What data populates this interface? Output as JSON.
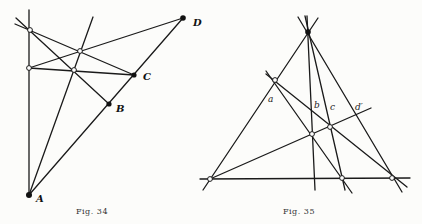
{
  "figures": [
    {
      "caption": "Fig. 34",
      "points": {
        "A": {
          "label": "A",
          "x": 29,
          "y": 195,
          "style": "filled"
        },
        "B": {
          "label": "B",
          "x": 109,
          "y": 104,
          "style": "filled"
        },
        "C": {
          "label": "C",
          "x": 134,
          "y": 75,
          "style": "filled"
        },
        "D": {
          "label": "D",
          "x": 183,
          "y": 18,
          "style": "filled"
        },
        "P1": {
          "label": "",
          "x": 30,
          "y": 30,
          "style": "open"
        },
        "P2": {
          "label": "",
          "x": 29,
          "y": 68,
          "style": "open"
        },
        "Q1": {
          "label": "",
          "x": 80,
          "y": 51,
          "style": "open"
        },
        "Q2": {
          "label": "",
          "x": 74,
          "y": 70,
          "style": "open"
        }
      }
    },
    {
      "caption": "Fig. 35",
      "points": {
        "V": {
          "label": "",
          "x": 308,
          "y": 32,
          "style": "filled"
        },
        "L": {
          "label": "",
          "x": 275,
          "y": 80,
          "style": "open"
        },
        "BL": {
          "label": "",
          "x": 210,
          "y": 179,
          "style": "open"
        },
        "BM": {
          "label": "",
          "x": 342,
          "y": 178,
          "style": "open"
        },
        "BR": {
          "label": "",
          "x": 392,
          "y": 178,
          "style": "open"
        },
        "M1": {
          "label": "",
          "x": 312,
          "y": 134,
          "style": "open"
        },
        "M2": {
          "label": "",
          "x": 330,
          "y": 127,
          "style": "open"
        }
      },
      "line_labels": [
        "a",
        "b",
        "c",
        "d′"
      ]
    }
  ]
}
